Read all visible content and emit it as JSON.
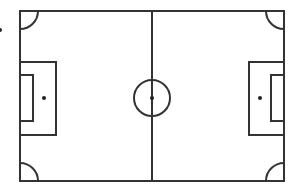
{
  "diagram": {
    "type": "soccer-field",
    "colors": {
      "line": "#333333",
      "background": "#ffffff",
      "spot": "#222222"
    },
    "field": {
      "x": 20,
      "y": 11,
      "width": 264,
      "height": 170
    },
    "center_line_x": 152,
    "center_circle": {
      "cx": 152,
      "cy": 98,
      "r": 18
    },
    "center_spot": {
      "cx": 152,
      "cy": 98,
      "r": 2
    },
    "left_penalty_area": {
      "x": 20,
      "y": 62,
      "width": 36,
      "height": 73
    },
    "left_goal_area": {
      "x": 20,
      "y": 75,
      "width": 13,
      "height": 46
    },
    "left_penalty_spot": {
      "cx": 44,
      "cy": 98,
      "r": 2
    },
    "right_penalty_area": {
      "x": 249,
      "y": 62,
      "width": 35,
      "height": 73
    },
    "right_goal_area": {
      "x": 271,
      "y": 75,
      "width": 13,
      "height": 46
    },
    "right_penalty_spot": {
      "cx": 260,
      "cy": 98,
      "r": 2
    },
    "corner_arc_radius": 18,
    "edge_marker": {
      "cx": 0,
      "cy": 30,
      "r": 2
    }
  }
}
